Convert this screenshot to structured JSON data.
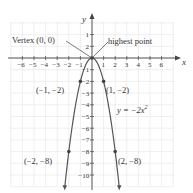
{
  "chart_data": {
    "type": "line",
    "title": "",
    "equation": "y = −2x²",
    "xlabel": "x",
    "ylabel": "y",
    "xlim": [
      -7,
      7
    ],
    "ylim": [
      -11,
      3
    ],
    "x_ticks": [
      -6,
      -5,
      -4,
      -3,
      -2,
      -1,
      1,
      2,
      3,
      4,
      5,
      6
    ],
    "x_tick_labels": [
      "−6",
      "−5",
      "−4",
      "−3",
      "−2",
      "−1",
      "1",
      "2",
      "3",
      "4",
      "5",
      "6"
    ],
    "y_ticks": [
      2,
      1,
      -1,
      -2,
      -3,
      -4,
      -5,
      -6,
      -7,
      -8,
      -9,
      -10
    ],
    "y_tick_labels": [
      "1",
      "2",
      "−1",
      "−2",
      "−3",
      "−4",
      "−5",
      "−6",
      "−7",
      "−8",
      "−9",
      "−10"
    ],
    "grid": true,
    "series": [
      {
        "name": "y = −2x²",
        "function": "-2*x^2",
        "x_range": [
          -2.35,
          2.35
        ],
        "color": "#555555"
      }
    ],
    "points": [
      {
        "x": 0,
        "y": 0,
        "label": "Vertex (0, 0)"
      },
      {
        "x": -1,
        "y": -2,
        "label": "(−1, −2)"
      },
      {
        "x": 1,
        "y": -2,
        "label": "(1, −2)"
      },
      {
        "x": -2,
        "y": -8,
        "label": "(−2, −8)"
      },
      {
        "x": 2,
        "y": -8,
        "label": "(2, −8)"
      }
    ],
    "annotations": [
      {
        "text": "Vertex (0, 0)",
        "points_to": [
          0,
          0
        ]
      },
      {
        "text": "highest point",
        "points_to": [
          0,
          0
        ]
      },
      {
        "text": "y = −2x²",
        "near": [
          2,
          -4.5
        ]
      }
    ]
  },
  "labels": {
    "x_axis": "x",
    "y_axis": "y",
    "vertex": "Vertex (0, 0)",
    "highest": "highest point",
    "p_m1": "(−1, −2)",
    "p_1": "(1, −2)",
    "p_m2": "(−2, −8)",
    "p_2": "(2, −8)",
    "equation_y": "y = −2x",
    "equation_exp": "2"
  },
  "colors": {
    "grid": "#e4e4e4",
    "axis": "#444444",
    "curve": "#555555",
    "text": "#333333"
  }
}
